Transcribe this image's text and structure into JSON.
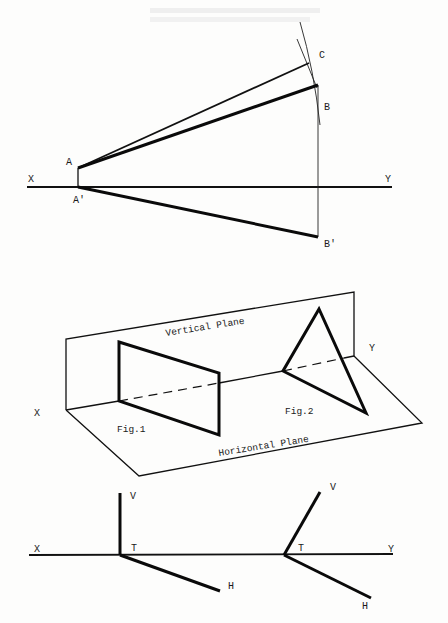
{
  "figure_top": {
    "title": "True length construction of line AB",
    "labels": {
      "x": "X",
      "y": "Y",
      "a": "A",
      "a_prime": "A'",
      "b": "B",
      "b_prime": "B'",
      "c": "C"
    }
  },
  "figure_middle": {
    "labels": {
      "vertical_plane": "Vertical Plane",
      "horizontal_plane": "Horizontal Plane",
      "x": "X",
      "y": "Y",
      "fig1": "Fig.1",
      "fig2": "Fig.2"
    }
  },
  "figure_bottom": {
    "labels": {
      "x": "X",
      "y": "Y",
      "v_left": "V",
      "t_left": "T",
      "h_left": "H",
      "v_right": "V",
      "t_right": "T",
      "h_right": "H"
    }
  },
  "colors": {
    "ink": "#111111",
    "paper": "#fdfdfc"
  }
}
